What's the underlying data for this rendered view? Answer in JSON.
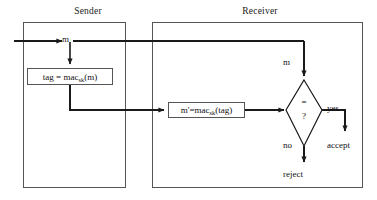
{
  "diagram": {
    "colors": {
      "stroke": "#1a1a1a",
      "container_border": "#555555",
      "background": "#ffffff",
      "text": "#111111"
    },
    "parties": [
      {
        "id": "sender",
        "label": "Sender"
      },
      {
        "id": "receiver",
        "label": "Receiver"
      }
    ],
    "nodes": {
      "sender_mac": {
        "text": "tag = mac",
        "subscript": "sk",
        "text_tail": "(m)"
      },
      "receiver_mac": {
        "text": "m'=mac",
        "subscript": "sk",
        "text_tail": "(tag)"
      },
      "decision": {
        "operator": "=",
        "query": "?"
      }
    },
    "edge_labels": {
      "message_sender": "m",
      "message_receiver": "m",
      "yes": "yes",
      "no": "no"
    },
    "terminals": {
      "accept": "accept",
      "reject": "reject"
    }
  }
}
